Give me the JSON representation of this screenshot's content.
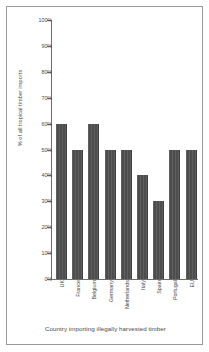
{
  "chart_data": {
    "type": "bar",
    "title": "",
    "xlabel": "Country importing illegally harvested timber",
    "ylabel": "% of all tropical timber imports",
    "categories": [
      "UK",
      "France",
      "Belgium",
      "Germany",
      "Netherlands",
      "Italy",
      "Spain",
      "Portugal",
      "EU"
    ],
    "values": [
      60,
      50,
      60,
      50,
      50,
      40,
      30,
      50,
      50
    ],
    "value_labels": [
      "60%",
      "50%",
      "60%",
      "50%",
      "50%",
      "40%",
      "30%",
      "50%",
      "50%"
    ],
    "ylim": [
      0,
      100
    ],
    "ytick_values": [
      100,
      90,
      80,
      70,
      60,
      50,
      40,
      30,
      20,
      10,
      0
    ],
    "ytick_labels": [
      "100%",
      "90%",
      "80%",
      "70%",
      "60%",
      "50%",
      "40%",
      "30%",
      "20%",
      "10%",
      "0%"
    ],
    "grid": false,
    "legend": false,
    "legend_position": "none",
    "bar_color": "#4d4d4d",
    "axis_color": "#6d6d6d",
    "text_color": "#4a4a4a",
    "background_color": "#ffffff",
    "frame_border_color": "#9a9a9a"
  }
}
